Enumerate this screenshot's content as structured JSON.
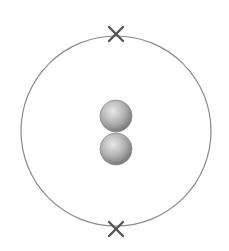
{
  "diagram": {
    "type": "atom-electron-shell",
    "shell": {
      "cx": 116,
      "cy": 131,
      "r": 95,
      "color": "#8a8a8a"
    },
    "electrons": [
      {
        "symbol": "x",
        "cx": 116,
        "cy": 34
      },
      {
        "symbol": "x",
        "cx": 116,
        "cy": 229
      }
    ],
    "nucleus": [
      {
        "cx": 116,
        "cy": 116,
        "r": 16
      },
      {
        "cx": 116,
        "cy": 149,
        "r": 16
      }
    ],
    "colors": {
      "electron": "#555555",
      "nucleus_light": "#e6e6e6",
      "nucleus_dark": "#808080"
    }
  }
}
